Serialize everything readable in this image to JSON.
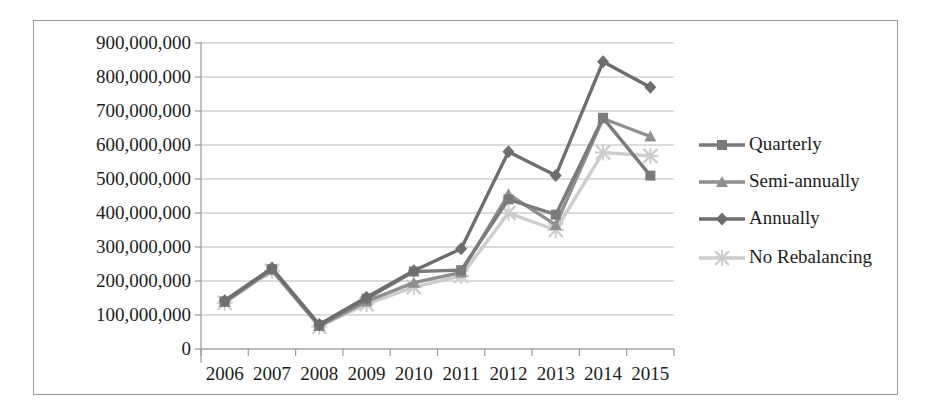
{
  "chart_data": {
    "type": "line",
    "title": "",
    "xlabel": "",
    "ylabel": "",
    "categories": [
      "2006",
      "2007",
      "2008",
      "2009",
      "2010",
      "2011",
      "2012",
      "2013",
      "2014",
      "2015"
    ],
    "ylim": [
      0,
      900000000
    ],
    "ytick_values": [
      0,
      100000000,
      200000000,
      300000000,
      400000000,
      500000000,
      600000000,
      700000000,
      800000000,
      900000000
    ],
    "ytick_labels": [
      "0",
      "100,000,000",
      "200,000,000",
      "300,000,000",
      "400,000,000",
      "500,000,000",
      "600,000,000",
      "700,000,000",
      "800,000,000",
      "900,000,000"
    ],
    "grid": true,
    "legend_position": "right",
    "series": [
      {
        "name": "Quarterly",
        "marker": "square",
        "color": "#7b7b7b",
        "values": [
          140000000,
          235000000,
          70000000,
          148000000,
          228000000,
          232000000,
          440000000,
          395000000,
          680000000,
          510000000
        ]
      },
      {
        "name": "Semi-annually",
        "marker": "triangle",
        "color": "#8f8f8f",
        "values": [
          138000000,
          233000000,
          68000000,
          140000000,
          195000000,
          225000000,
          455000000,
          365000000,
          678000000,
          625000000
        ]
      },
      {
        "name": "Annually",
        "marker": "diamond",
        "color": "#6e6e6e",
        "values": [
          142000000,
          238000000,
          72000000,
          152000000,
          230000000,
          295000000,
          580000000,
          510000000,
          845000000,
          770000000
        ]
      },
      {
        "name": "No Rebalancing",
        "marker": "cross",
        "color": "#cdcdcd",
        "values": [
          136000000,
          230000000,
          66000000,
          132000000,
          182000000,
          215000000,
          400000000,
          350000000,
          578000000,
          568000000
        ]
      }
    ]
  },
  "legend": {
    "items": [
      {
        "label": "Quarterly",
        "marker": "square-marker-icon"
      },
      {
        "label": "Semi-annually",
        "marker": "triangle-marker-icon"
      },
      {
        "label": "Annually",
        "marker": "diamond-marker-icon"
      },
      {
        "label": "No Rebalancing",
        "marker": "cross-marker-icon"
      }
    ]
  },
  "colors": {
    "axis": "#9a9a9a",
    "grid": "#b9b9b9",
    "text": "#1d1d1d",
    "frame": "#9a9a9a"
  }
}
